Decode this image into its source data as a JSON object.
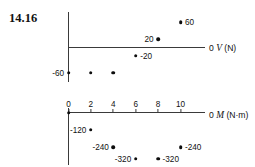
{
  "figure": {
    "problem_number": "14.16"
  },
  "chart_data": [
    {
      "type": "scatter",
      "title": "",
      "name": "shear-diagram",
      "xlabel": "",
      "ylabel": "",
      "axis_caption_zero": "0",
      "axis_caption_var": "V",
      "axis_caption_unit": "(N)",
      "x": [
        0,
        2,
        4,
        6,
        8,
        10
      ],
      "values": [
        -60,
        -60,
        -60,
        -20,
        20,
        60
      ],
      "xlim": [
        0,
        10
      ],
      "ylim": [
        -80,
        80
      ],
      "grid": false,
      "point_labels": [
        {
          "x": 0,
          "y": -60,
          "text": "-60",
          "side": "left"
        },
        {
          "x": 2,
          "y": -60,
          "text": "",
          "side": "right"
        },
        {
          "x": 4,
          "y": -60,
          "text": "",
          "side": "right"
        },
        {
          "x": 6,
          "y": -20,
          "text": "-20",
          "side": "right"
        },
        {
          "x": 8,
          "y": 20,
          "text": "20",
          "side": "left"
        },
        {
          "x": 10,
          "y": 60,
          "text": "60",
          "side": "right"
        }
      ],
      "tick_labels": []
    },
    {
      "type": "scatter",
      "title": "",
      "name": "moment-diagram",
      "xlabel": "",
      "ylabel": "",
      "axis_caption_zero": "0",
      "axis_caption_var": "M",
      "axis_caption_unit": "(N·m)",
      "x": [
        0,
        2,
        4,
        6,
        8,
        10
      ],
      "values": [
        0,
        -120,
        -240,
        -320,
        -320,
        -240
      ],
      "xlim": [
        0,
        10
      ],
      "ylim": [
        -360,
        0
      ],
      "grid": false,
      "point_labels": [
        {
          "x": 0,
          "y": 0,
          "text": "",
          "side": "right"
        },
        {
          "x": 2,
          "y": -120,
          "text": "-120",
          "side": "left"
        },
        {
          "x": 4,
          "y": -240,
          "text": "-240",
          "side": "left"
        },
        {
          "x": 6,
          "y": -320,
          "text": "-320",
          "side": "left"
        },
        {
          "x": 8,
          "y": -320,
          "text": "-320",
          "side": "right"
        },
        {
          "x": 10,
          "y": -240,
          "text": "-240",
          "side": "right"
        }
      ],
      "tick_labels": [
        "0",
        "2",
        "4",
        "6",
        "8",
        "10"
      ]
    }
  ]
}
